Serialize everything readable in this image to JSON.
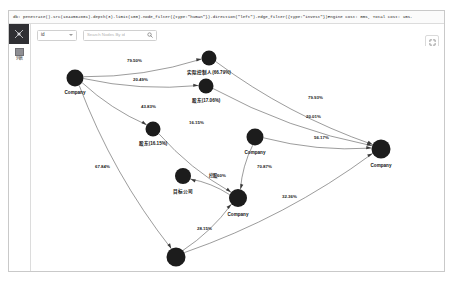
{
  "window": {
    "query_text": "db: penetrate().src(1844562801).depth(3).limit(100).node_filter({type:\"human\"}).direction(\"left\").edge_filter({type:\"invest\"})Engine cost: 0ms, Total cost: 1ms."
  },
  "sidebar": {
    "logo_icon": "app-logo-icon",
    "items": [
      {
        "icon": "grid-list-icon",
        "label": "列表"
      }
    ]
  },
  "toolbar": {
    "select_value": "id",
    "select_caret_icon": "chevron-down-icon",
    "search_placeholder": "Search Nodes By id",
    "search_icon": "search-icon"
  },
  "tools": [
    {
      "name": "fullscreen-button",
      "icon": "fullscreen-icon"
    },
    {
      "name": "link-button",
      "icon": "link-icon"
    },
    {
      "name": "layout-button",
      "icon": "layout-icon"
    },
    {
      "name": "settings-button",
      "icon": "gear-icon"
    }
  ],
  "graph": {
    "nodes": [
      {
        "id": "n1",
        "label": "Company",
        "x": 44,
        "y": 32,
        "r": 8.5
      },
      {
        "id": "n2",
        "label": "实际控制人(66.79%)",
        "x": 178,
        "y": 12,
        "r": 7.5,
        "label_dy": 16
      },
      {
        "id": "n3",
        "label": "股东(17.06%)",
        "x": 175,
        "y": 40,
        "r": 7.5,
        "label_dy": 16
      },
      {
        "id": "n4",
        "label": "股东(16.15%)",
        "x": 122,
        "y": 83,
        "r": 7.5,
        "label_dy": 16
      },
      {
        "id": "n5",
        "label": "Company",
        "x": 224,
        "y": 91,
        "r": 8.5,
        "label_dy": 17
      },
      {
        "id": "n6",
        "label": "目标公司",
        "x": 152,
        "y": 130,
        "r": 8.0,
        "label_dy": 17
      },
      {
        "id": "n7",
        "label": "Company",
        "x": 207,
        "y": 152,
        "r": 9.0,
        "label_dy": 18
      },
      {
        "id": "n8",
        "label": "Company",
        "x": 350,
        "y": 103,
        "r": 9.5,
        "label_dy": 18
      },
      {
        "id": "n9",
        "label": "Company",
        "x": 145,
        "y": 211,
        "r": 9.5,
        "label_dy": 19
      }
    ],
    "edges": [
      {
        "from": "n1",
        "to": "n2",
        "label": "79.50%",
        "lx": 96,
        "ly": 16
      },
      {
        "from": "n1",
        "to": "n3",
        "label": "20.49%",
        "lx": 102,
        "ly": 35
      },
      {
        "from": "n1",
        "to": "n4",
        "label": "43.83%",
        "lx": 110,
        "ly": 62
      },
      {
        "from": "n2",
        "to": "n8",
        "label": "79.93%",
        "lx": 277,
        "ly": 53
      },
      {
        "from": "n3",
        "to": "n8",
        "label": "20.01%",
        "lx": 275,
        "ly": 72
      },
      {
        "from": "n5",
        "to": "n8",
        "label": "56.17%",
        "lx": 283,
        "ly": 93
      },
      {
        "from": "n4",
        "to": "n7",
        "label": "16.15%",
        "lx": 158,
        "ly": 78
      },
      {
        "from": "n7",
        "to": "n6",
        "label": "控股60%",
        "lx": 178,
        "ly": 131
      },
      {
        "from": "n5",
        "to": "n7",
        "label": "70.87%",
        "lx": 226,
        "ly": 122
      },
      {
        "from": "n1",
        "to": "n9",
        "label": "67.84%",
        "lx": 64,
        "ly": 122
      },
      {
        "from": "n9",
        "to": "n7",
        "label": "28.15%",
        "lx": 166,
        "ly": 184
      },
      {
        "from": "n9",
        "to": "n8",
        "label": "32.36%",
        "lx": 251,
        "ly": 152
      }
    ]
  }
}
